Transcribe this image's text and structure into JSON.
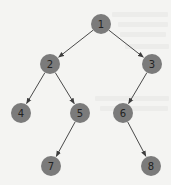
{
  "diagram": {
    "type": "binary-tree",
    "colors": {
      "node_fill": "#7b7b7b",
      "node_text": "#222222",
      "edge": "#4a4a4a",
      "background": "#f4f4f2"
    },
    "node_radius": 10,
    "nodes": [
      {
        "id": "1",
        "label": "1",
        "x": 101,
        "y": 24
      },
      {
        "id": "2",
        "label": "2",
        "x": 50,
        "y": 64
      },
      {
        "id": "3",
        "label": "3",
        "x": 152,
        "y": 64
      },
      {
        "id": "4",
        "label": "4",
        "x": 21,
        "y": 113
      },
      {
        "id": "5",
        "label": "5",
        "x": 80,
        "y": 113
      },
      {
        "id": "6",
        "label": "6",
        "x": 123,
        "y": 113
      },
      {
        "id": "7",
        "label": "7",
        "x": 51,
        "y": 166
      },
      {
        "id": "8",
        "label": "8",
        "x": 151,
        "y": 166
      }
    ],
    "edges": [
      {
        "from": "1",
        "to": "2"
      },
      {
        "from": "1",
        "to": "3"
      },
      {
        "from": "2",
        "to": "4"
      },
      {
        "from": "2",
        "to": "5"
      },
      {
        "from": "3",
        "to": "6"
      },
      {
        "from": "5",
        "to": "7"
      },
      {
        "from": "6",
        "to": "8"
      }
    ]
  }
}
